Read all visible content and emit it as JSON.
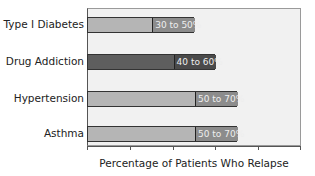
{
  "chart_data": {
    "type": "bar",
    "orientation": "horizontal",
    "title": "",
    "xlabel": "Percentage of Patients Who Relapse",
    "ylabel": "",
    "xlim": [
      0,
      100
    ],
    "grid": false,
    "tick_positions": [
      0,
      20,
      40,
      60,
      80,
      100
    ],
    "tick_labels_shown": false,
    "categories": [
      "Type I Diabetes",
      "Drug Addiction",
      "Hypertension",
      "Asthma"
    ],
    "series": [
      {
        "name": "Relapse range low",
        "values": [
          30,
          40,
          50,
          50
        ]
      },
      {
        "name": "Relapse range high",
        "values": [
          50,
          60,
          70,
          70
        ]
      }
    ],
    "data_labels": [
      "30 to 50%",
      "40 to 60%",
      "50 to 70%",
      "50 to 70%"
    ],
    "highlighted_category": "Drug Addiction"
  },
  "bars": [
    {
      "label": "Type I Diabetes",
      "low": 30,
      "high": 50,
      "range_text": "30 to 50%",
      "base_color": "#b5b5b5",
      "range_color": "#8c8c8c",
      "top": 17
    },
    {
      "label": "Drug Addiction",
      "low": 40,
      "high": 60,
      "range_text": "40 to 60%",
      "base_color": "#5e5e5e",
      "range_color": "#4a4a4a",
      "top": 54
    },
    {
      "label": "Hypertension",
      "low": 50,
      "high": 70,
      "range_text": "50 to 70%",
      "base_color": "#b5b5b5",
      "range_color": "#8c8c8c",
      "top": 91
    },
    {
      "label": "Asthma",
      "low": 50,
      "high": 70,
      "range_text": "50 to 70%",
      "base_color": "#b5b5b5",
      "range_color": "#8c8c8c",
      "top": 126
    }
  ]
}
